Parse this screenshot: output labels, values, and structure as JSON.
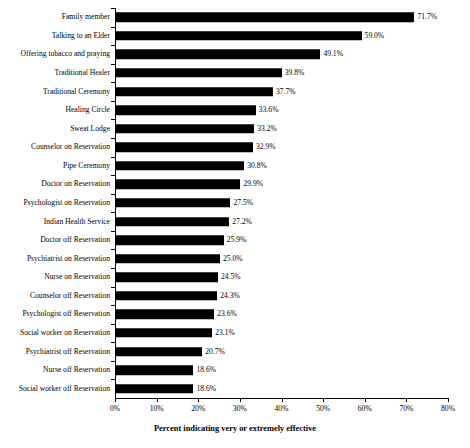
{
  "chart_data": {
    "type": "bar",
    "orientation": "horizontal",
    "title": "",
    "xlabel": "Percent indicating very or extremely effective",
    "ylabel": "",
    "xlim": [
      0,
      80
    ],
    "xtick_step": 10,
    "grid": false,
    "legend": false,
    "bar_color": "#000000",
    "value_label_suffix": "%",
    "xticklabels": [
      "0%",
      "10%",
      "20%",
      "30%",
      "40%",
      "50%",
      "60%",
      "70%",
      "80%"
    ],
    "xtickvalues": [
      0,
      10,
      20,
      30,
      40,
      50,
      60,
      70,
      80
    ],
    "categories": [
      "Family member",
      "Talking to an Elder",
      "Offering tobacco and praying",
      "Traditional Healer",
      "Traditional Ceremony",
      "Healing Circle",
      "Sweat Lodge",
      "Counselor on Reservation",
      "Pipe Ceremony",
      "Doctor on Reservation",
      "Psychologist on Reservation",
      "Indian Health Service",
      "Doctor off Reservation",
      "Psychiatrist on Reservation",
      "Nurse on Reservation",
      "Counselor off Reservation",
      "Psychologist off Reservation",
      "Social worker on Reservation",
      "Psychiatrist off Reservation",
      "Nurse off Reservation",
      "Social worker off Reservation"
    ],
    "values": [
      71.7,
      59.0,
      49.1,
      39.8,
      37.7,
      33.6,
      33.2,
      32.9,
      30.8,
      29.9,
      27.5,
      27.2,
      25.9,
      25.0,
      24.5,
      24.3,
      23.6,
      23.1,
      20.7,
      18.6,
      18.6
    ],
    "value_labels": [
      "71.7%",
      "59.0%",
      "49.1%",
      "39.8%",
      "37.7%",
      "33.6%",
      "33.2%",
      "32.9%",
      "30.8%",
      "29.9%",
      "27.5%",
      "27.2%",
      "25.9%",
      "25.0%",
      "24.5%",
      "24.3%",
      "23.6%",
      "23.1%",
      "20.7%",
      "18.6%",
      "18.6%"
    ]
  }
}
